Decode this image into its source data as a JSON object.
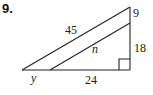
{
  "problem": {
    "number": "9."
  },
  "figure": {
    "labels": {
      "hypotenuse_outer": "45",
      "inner_segment": "n",
      "base_left": "y",
      "base_right": "24",
      "side_top": "9",
      "side_bottom": "18"
    },
    "right_angle_marker": true,
    "vertices": {
      "left": [
        22,
        70
      ],
      "top": [
        130,
        7
      ],
      "bottom_right": [
        130,
        70
      ],
      "inner_base": [
        50,
        70
      ],
      "inner_side": [
        130,
        23
      ]
    }
  }
}
